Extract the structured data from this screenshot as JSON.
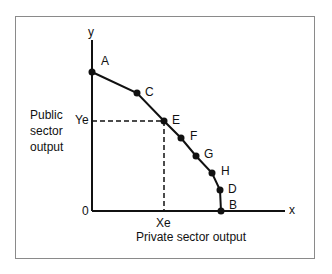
{
  "diagram": {
    "axes": {
      "x_label": "x",
      "y_label": "y",
      "origin_label": "0",
      "x_title": "Private sector output",
      "y_title_lines": [
        "Public",
        "sector",
        "output"
      ]
    },
    "equilibrium": {
      "x_label": "Xe",
      "y_label": "Ye"
    },
    "points": [
      {
        "label": "A",
        "x": 92,
        "y": 72
      },
      {
        "label": "C",
        "x": 137,
        "y": 93
      },
      {
        "label": "E",
        "x": 164,
        "y": 121
      },
      {
        "label": "F",
        "x": 181,
        "y": 138
      },
      {
        "label": "G",
        "x": 196,
        "y": 156
      },
      {
        "label": "H",
        "x": 212,
        "y": 173
      },
      {
        "label": "D",
        "x": 220,
        "y": 190
      },
      {
        "label": "B",
        "x": 221,
        "y": 211
      }
    ],
    "colors": {
      "line": "#111111",
      "frame": "#8a8a8a"
    }
  }
}
